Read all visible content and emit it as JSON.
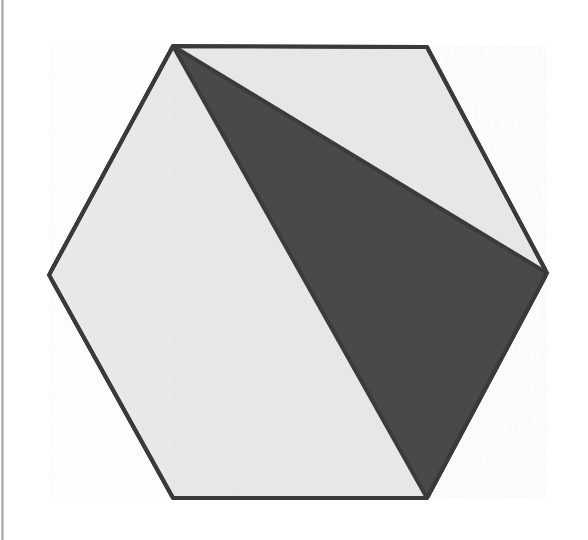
{
  "figure": {
    "canvas": {
      "width": 588,
      "height": 540,
      "background": "#ffffff"
    },
    "colors": {
      "background": "#ffffff",
      "light_fill": "#e8e8e8",
      "dark_fill": "#4a4a4a",
      "outline": "#3a3a3a",
      "scan_edge": "#a8a8a8"
    },
    "stroke_width": 4,
    "shapes": {
      "hexagon": {
        "name": "hexagon",
        "fill": "#e8e8e8",
        "stroke": "#3a3a3a",
        "points": "173,46 427,47 547,273 427,498 173,498 49,275",
        "vertices": [
          {
            "label": "top-left",
            "x": 173,
            "y": 46
          },
          {
            "label": "top-right",
            "x": 427,
            "y": 47
          },
          {
            "label": "right",
            "x": 547,
            "y": 273
          },
          {
            "label": "bottom-right",
            "x": 427,
            "y": 498
          },
          {
            "label": "bottom-left",
            "x": 173,
            "y": 498
          },
          {
            "label": "left",
            "x": 49,
            "y": 275
          }
        ]
      },
      "shaded_triangle": {
        "name": "shaded-triangle",
        "fill": "#4a4a4a",
        "stroke": "#3a3a3a",
        "points": "173,46 547,273 427,498",
        "vertices": [
          {
            "label": "apex-top-left",
            "x": 173,
            "y": 46
          },
          {
            "label": "right",
            "x": 547,
            "y": 273
          },
          {
            "label": "bottom-right",
            "x": 427,
            "y": 498
          }
        ]
      }
    }
  },
  "chart_data": {
    "type": "diagram",
    "polygons": [
      {
        "name": "hexagon",
        "sides": 6,
        "fill": "#e8e8e8",
        "points": [
          [
            173,
            46
          ],
          [
            427,
            47
          ],
          [
            547,
            273
          ],
          [
            427,
            498
          ],
          [
            173,
            498
          ],
          [
            49,
            275
          ]
        ]
      },
      {
        "name": "shaded-triangle",
        "sides": 3,
        "fill": "#4a4a4a",
        "points": [
          [
            173,
            46
          ],
          [
            547,
            273
          ],
          [
            427,
            498
          ]
        ]
      }
    ],
    "xlabel": "",
    "ylabel": "",
    "grid": false,
    "legend": "none"
  }
}
